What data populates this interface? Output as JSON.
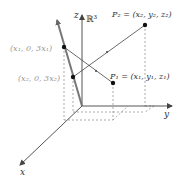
{
  "diagram": {
    "space_label": "ℝ³",
    "axes": {
      "x": "x",
      "y": "y",
      "z": "z"
    },
    "points": {
      "P1": {
        "name": "P₁",
        "label": "P₁ = (x₁, y₁, z₁)"
      },
      "P2": {
        "name": "P₂",
        "label": "P₂ = (x₂, y₂, z₂)"
      },
      "Q1": {
        "label": "(x₁, 0, 3x₁)"
      },
      "Q2": {
        "label": "(x₂, 0, 3x₂)"
      }
    },
    "colors": {
      "axis": "#555555",
      "plane_line": "#777777",
      "gray_label": "#999999",
      "dashed": "#888888",
      "text": "#333333"
    }
  }
}
